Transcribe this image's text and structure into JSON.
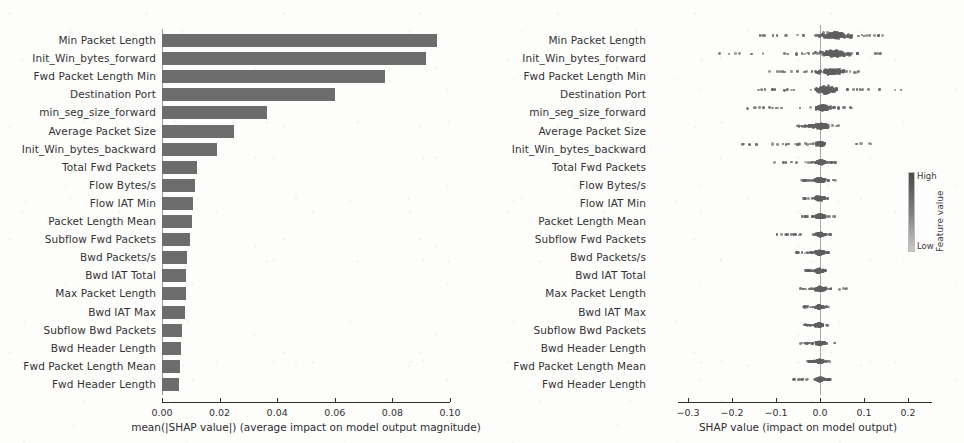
{
  "figure": {
    "background_color": "#fdfdfc",
    "bar_color": "#6d6d6d",
    "dot_color": "#5f5f5f"
  },
  "chart_data": [
    {
      "type": "bar",
      "panel": "left",
      "title": "",
      "xlabel": "mean(|SHAP value|) (average impact on model output magnitude)",
      "ylabel": "",
      "xlim": [
        0.0,
        0.1
      ],
      "xticks": [
        "0.00",
        "0.02",
        "0.04",
        "0.06",
        "0.08",
        "0.10"
      ],
      "xtick_values": [
        0.0,
        0.02,
        0.04,
        0.06,
        0.08,
        0.1
      ],
      "grid": false,
      "orientation": "horizontal",
      "categories": [
        "Min Packet Length",
        "Init_Win_bytes_forward",
        "Fwd Packet Length Min",
        "Destination Port",
        "min_seg_size_forward",
        "Average Packet Size",
        "Init_Win_bytes_backward",
        "Total Fwd Packets",
        "Flow Bytes/s",
        "Flow IAT Min",
        "Packet Length Mean",
        "Subflow Fwd Packets",
        "Bwd Packets/s",
        "Bwd IAT Total",
        "Max Packet Length",
        "Bwd IAT Max",
        "Subflow Bwd Packets",
        "Bwd Header Length",
        "Fwd Packet Length Mean",
        "Fwd Header Length"
      ],
      "values": [
        0.0955,
        0.0915,
        0.0775,
        0.06,
        0.0365,
        0.025,
        0.019,
        0.0123,
        0.0113,
        0.0108,
        0.0103,
        0.0097,
        0.0088,
        0.0085,
        0.0082,
        0.008,
        0.007,
        0.0066,
        0.0063,
        0.0058
      ]
    },
    {
      "type": "scatter",
      "panel": "right",
      "plot_style": "beeswarm",
      "title": "",
      "xlabel": "SHAP value (impact on model output)",
      "ylabel": "",
      "xlim": [
        -0.32,
        0.24
      ],
      "xticks": [
        "−0.3",
        "−0.2",
        "−0.1",
        "0.0",
        "0.1",
        "0.2"
      ],
      "xtick_values": [
        -0.3,
        -0.2,
        -0.1,
        0.0,
        0.1,
        0.2
      ],
      "grid": false,
      "zero_line": 0.0,
      "categories": [
        "Min Packet Length",
        "Init_Win_bytes_forward",
        "Fwd Packet Length Min",
        "Destination Port",
        "min_seg_size_forward",
        "Average Packet Size",
        "Init_Win_bytes_backward",
        "Total Fwd Packets",
        "Flow Bytes/s",
        "Flow IAT Min",
        "Packet Length Mean",
        "Subflow Fwd Packets",
        "Bwd Packets/s",
        "Bwd IAT Total",
        "Max Packet Length",
        "Bwd IAT Max",
        "Subflow Bwd Packets",
        "Bwd Header Length",
        "Fwd Packet Length Mean",
        "Fwd Header Length"
      ],
      "rows": [
        {
          "feature": "Min Packet Length",
          "min": -0.15,
          "max": 0.16,
          "dense_min": -0.01,
          "dense_max": 0.075,
          "peak": 0.035,
          "spread": 0.85
        },
        {
          "feature": "Init_Win_bytes_forward",
          "min": -0.23,
          "max": 0.15,
          "dense_min": -0.01,
          "dense_max": 0.07,
          "peak": 0.03,
          "spread": 0.85
        },
        {
          "feature": "Fwd Packet Length Min",
          "min": -0.135,
          "max": 0.105,
          "dense_min": -0.008,
          "dense_max": 0.055,
          "peak": 0.025,
          "spread": 0.8
        },
        {
          "feature": "Destination Port",
          "min": -0.145,
          "max": 0.205,
          "dense_min": -0.01,
          "dense_max": 0.04,
          "peak": 0.012,
          "spread": 0.95
        },
        {
          "feature": "min_seg_size_forward",
          "min": -0.165,
          "max": 0.085,
          "dense_min": -0.01,
          "dense_max": 0.025,
          "peak": 0.008,
          "spread": 0.7
        },
        {
          "feature": "Average Packet Size",
          "min": -0.055,
          "max": 0.045,
          "dense_min": -0.025,
          "dense_max": 0.02,
          "peak": 0.004,
          "spread": 0.65
        },
        {
          "feature": "Init_Win_bytes_backward",
          "min": -0.18,
          "max": 0.13,
          "dense_min": -0.008,
          "dense_max": 0.012,
          "peak": 0.002,
          "spread": 0.55
        },
        {
          "feature": "Total Fwd Packets",
          "min": -0.105,
          "max": 0.035,
          "dense_min": -0.01,
          "dense_max": 0.012,
          "peak": 0.001,
          "spread": 0.5
        },
        {
          "feature": "Flow Bytes/s",
          "min": -0.045,
          "max": 0.035,
          "dense_min": -0.012,
          "dense_max": 0.012,
          "peak": 0.0,
          "spread": 0.5
        },
        {
          "feature": "Flow IAT Min",
          "min": -0.038,
          "max": 0.025,
          "dense_min": -0.012,
          "dense_max": 0.01,
          "peak": -0.002,
          "spread": 0.48
        },
        {
          "feature": "Packet Length Mean",
          "min": -0.042,
          "max": 0.035,
          "dense_min": -0.012,
          "dense_max": 0.012,
          "peak": 0.0,
          "spread": 0.48
        },
        {
          "feature": "Subflow Fwd Packets",
          "min": -0.098,
          "max": 0.03,
          "dense_min": -0.008,
          "dense_max": 0.01,
          "peak": 0.0,
          "spread": 0.46
        },
        {
          "feature": "Bwd Packets/s",
          "min": -0.055,
          "max": 0.025,
          "dense_min": -0.01,
          "dense_max": 0.01,
          "peak": 0.0,
          "spread": 0.46
        },
        {
          "feature": "Bwd IAT Total",
          "min": -0.035,
          "max": 0.018,
          "dense_min": -0.012,
          "dense_max": 0.008,
          "peak": -0.003,
          "spread": 0.44
        },
        {
          "feature": "Max Packet Length",
          "min": -0.048,
          "max": 0.062,
          "dense_min": -0.012,
          "dense_max": 0.015,
          "peak": 0.0,
          "spread": 0.52
        },
        {
          "feature": "Bwd IAT Max",
          "min": -0.04,
          "max": 0.02,
          "dense_min": -0.01,
          "dense_max": 0.008,
          "peak": -0.002,
          "spread": 0.44
        },
        {
          "feature": "Subflow Bwd Packets",
          "min": -0.038,
          "max": 0.018,
          "dense_min": -0.012,
          "dense_max": 0.008,
          "peak": -0.002,
          "spread": 0.44
        },
        {
          "feature": "Bwd Header Length",
          "min": -0.045,
          "max": 0.035,
          "dense_min": -0.01,
          "dense_max": 0.01,
          "peak": -0.001,
          "spread": 0.46
        },
        {
          "feature": "Fwd Packet Length Mean",
          "min": -0.03,
          "max": 0.022,
          "dense_min": -0.01,
          "dense_max": 0.008,
          "peak": -0.001,
          "spread": 0.42
        },
        {
          "feature": "Fwd Header Length",
          "min": -0.062,
          "max": 0.03,
          "dense_min": -0.01,
          "dense_max": 0.01,
          "peak": 0.0,
          "spread": 0.46
        }
      ],
      "colorbar": {
        "high_label": "High",
        "low_label": "Low",
        "axis_label": "Feature value",
        "high_color": "#4a4a4a",
        "low_color": "#c9c9c9"
      }
    }
  ]
}
